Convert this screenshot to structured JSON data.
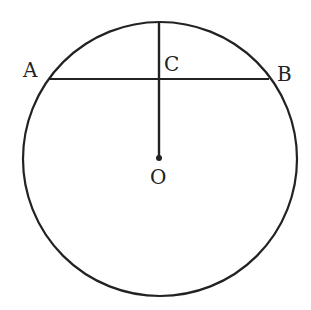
{
  "diagram": {
    "type": "circle-geometry",
    "labels": {
      "A": "A",
      "B": "B",
      "C": "C",
      "O": "O"
    },
    "circle": {
      "cx": 160,
      "cy": 159,
      "r": 137
    },
    "chord": {
      "from": "A",
      "to": "B"
    },
    "segment": {
      "from": "O",
      "to": "top of circle",
      "through": "C"
    },
    "stroke_color": "#222222"
  }
}
